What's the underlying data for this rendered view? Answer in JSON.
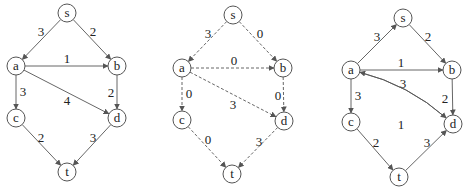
{
  "panels": [
    {
      "id": "original-network",
      "style": "solid",
      "nodes": [
        {
          "id": "s",
          "label": "s",
          "x": 67,
          "y": 13
        },
        {
          "id": "a",
          "label": "a",
          "x": 16,
          "y": 66
        },
        {
          "id": "b",
          "label": "b",
          "x": 117,
          "y": 66
        },
        {
          "id": "c",
          "label": "c",
          "x": 16,
          "y": 118
        },
        {
          "id": "d",
          "label": "d",
          "x": 117,
          "y": 118
        },
        {
          "id": "t",
          "label": "t",
          "x": 67,
          "y": 172
        }
      ],
      "edges": [
        {
          "from": "s",
          "to": "a",
          "label": "3",
          "lx": 41,
          "ly": 31
        },
        {
          "from": "s",
          "to": "b",
          "label": "2",
          "lx": 93,
          "ly": 31
        },
        {
          "from": "a",
          "to": "b",
          "label": "1",
          "lx": 67,
          "ly": 58
        },
        {
          "from": "a",
          "to": "c",
          "label": "3",
          "lx": 23,
          "ly": 91
        },
        {
          "from": "a",
          "to": "d",
          "label": "4",
          "lx": 67,
          "ly": 100
        },
        {
          "from": "b",
          "to": "d",
          "label": "2",
          "lx": 111,
          "ly": 92
        },
        {
          "from": "c",
          "to": "t",
          "label": "2",
          "lx": 41,
          "ly": 137
        },
        {
          "from": "d",
          "to": "t",
          "label": "3",
          "lx": 93,
          "ly": 137
        }
      ]
    },
    {
      "id": "flow-network",
      "style": "dashed",
      "nodes": [
        {
          "id": "s",
          "label": "s",
          "x": 233,
          "y": 15
        },
        {
          "id": "a",
          "label": "a",
          "x": 182,
          "y": 68
        },
        {
          "id": "b",
          "label": "b",
          "x": 283,
          "y": 68
        },
        {
          "id": "c",
          "label": "c",
          "x": 182,
          "y": 120
        },
        {
          "id": "d",
          "label": "d",
          "x": 284,
          "y": 121
        },
        {
          "id": "t",
          "label": "t",
          "x": 232,
          "y": 174
        }
      ],
      "edges": [
        {
          "from": "s",
          "to": "a",
          "label": "3",
          "lx": 208,
          "ly": 33
        },
        {
          "from": "s",
          "to": "b",
          "label": "0",
          "lx": 260,
          "ly": 33
        },
        {
          "from": "a",
          "to": "b",
          "label": "0",
          "lx": 234,
          "ly": 60
        },
        {
          "from": "a",
          "to": "c",
          "label": "0",
          "lx": 189,
          "ly": 93
        },
        {
          "from": "a",
          "to": "d",
          "label": "3",
          "lx": 233,
          "ly": 104
        },
        {
          "from": "b",
          "to": "d",
          "label": "0",
          "lx": 278,
          "ly": 95
        },
        {
          "from": "c",
          "to": "t",
          "label": "0",
          "lx": 208,
          "ly": 139
        },
        {
          "from": "d",
          "to": "t",
          "label": "3",
          "lx": 259,
          "ly": 141
        }
      ]
    },
    {
      "id": "residual-network",
      "style": "solid",
      "nodes": [
        {
          "id": "s",
          "label": "s",
          "x": 403,
          "y": 18
        },
        {
          "id": "a",
          "label": "a",
          "x": 351,
          "y": 70
        },
        {
          "id": "b",
          "label": "b",
          "x": 452,
          "y": 70
        },
        {
          "id": "c",
          "label": "c",
          "x": 351,
          "y": 122
        },
        {
          "id": "d",
          "label": "d",
          "x": 453,
          "y": 124
        },
        {
          "id": "t",
          "label": "t",
          "x": 399,
          "y": 177
        }
      ],
      "edges": [
        {
          "from": "a",
          "to": "s",
          "label": "3",
          "lx": 377,
          "ly": 36
        },
        {
          "from": "s",
          "to": "b",
          "label": "2",
          "lx": 428,
          "ly": 36
        },
        {
          "from": "a",
          "to": "b",
          "label": "1",
          "lx": 401,
          "ly": 62
        },
        {
          "from": "a",
          "to": "c",
          "label": "3",
          "lx": 358,
          "ly": 95
        },
        {
          "from": "d",
          "to": "a",
          "label": "3",
          "lx": 403,
          "ly": 83,
          "curve": "up"
        },
        {
          "from": "a",
          "to": "d",
          "label": "1",
          "lx": 401,
          "ly": 124,
          "curve": "down"
        },
        {
          "from": "b",
          "to": "d",
          "label": "2",
          "lx": 445,
          "ly": 98
        },
        {
          "from": "c",
          "to": "t",
          "label": "2",
          "lx": 376,
          "ly": 142
        },
        {
          "from": "t",
          "to": "d",
          "label": "3",
          "lx": 427,
          "ly": 142
        }
      ]
    }
  ],
  "colors": {
    "stroke": "#555555",
    "text": "#222222",
    "background": "#ffffff"
  },
  "node_radius": 9
}
